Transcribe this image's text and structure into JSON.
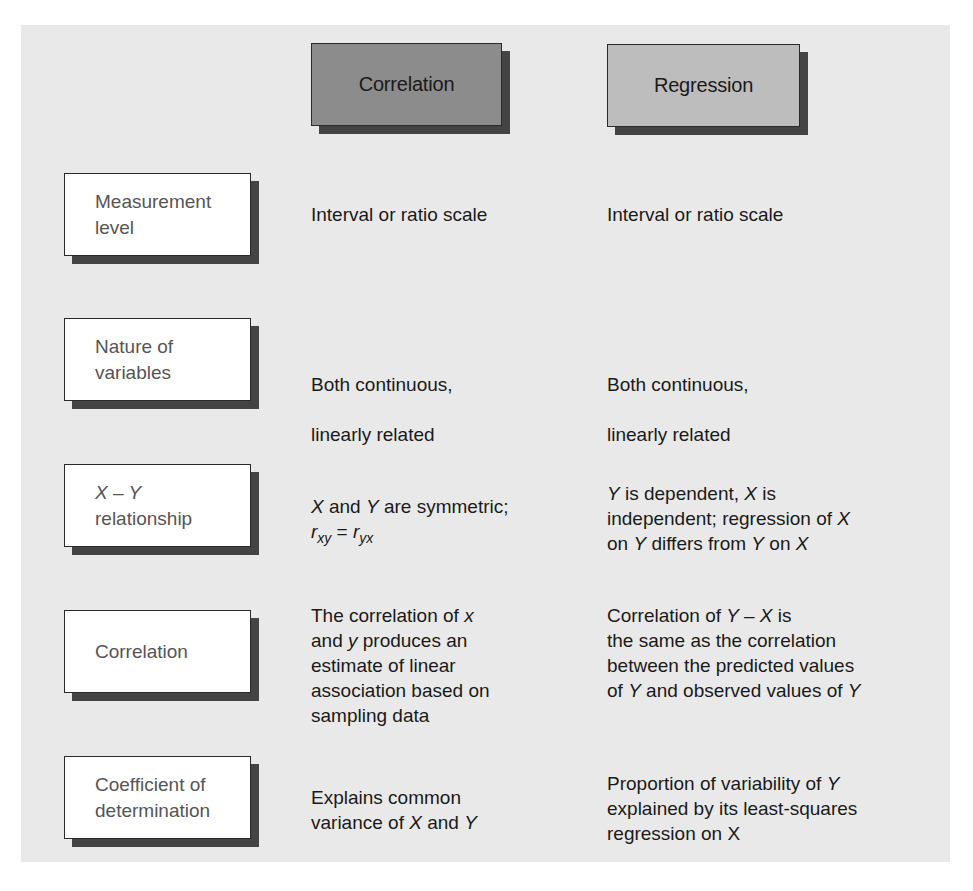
{
  "headers": {
    "correlation": {
      "label": "Correlation",
      "fill": "#8c8c8c"
    },
    "regression": {
      "label": "Regression",
      "fill": "#bdbdbd"
    }
  },
  "rows": [
    {
      "label": "Measurement level",
      "label_lines": [
        "Measurement",
        "level"
      ],
      "correlation": "Interval or ratio scale",
      "regression": "Interval or ratio scale"
    },
    {
      "label": "Nature of variables",
      "label_lines": [
        "Nature of",
        "variables"
      ],
      "correlation": "Both continuous, linearly related",
      "correlation_lines": [
        "Both continuous,",
        "linearly related"
      ],
      "regression": "Both continuous, linearly related",
      "regression_lines": [
        "Both continuous,",
        "linearly related"
      ]
    },
    {
      "label": "X – Y relationship",
      "label_lines": [
        "X – Y",
        "relationship"
      ],
      "correlation": "X and Y are symmetric; r_xy = r_yx",
      "correlation_parts": {
        "line1_a": "X",
        "line1_b": " and ",
        "line1_c": "Y",
        "line1_d": " are symmetric;",
        "r1": "r",
        "sub1": "xy",
        "eq": " = ",
        "r2": "r",
        "sub2": "yx"
      },
      "regression": "Y is dependent, X is independent; regression of X on Y differs from Y on X",
      "regression_parts": {
        "l1_a": "Y",
        "l1_b": " is dependent, ",
        "l1_c": "X",
        "l1_d": " is",
        "l2_a": "independent; regression of ",
        "l2_b": "X",
        "l3_a": "on ",
        "l3_b": "Y",
        "l3_c": " differs from ",
        "l3_d": "Y",
        "l3_e": " on ",
        "l3_f": "X"
      }
    },
    {
      "label": "Correlation",
      "label_lines": [
        "Correlation"
      ],
      "correlation": "The correlation of x and y produces an estimate of linear association based on sampling data",
      "correlation_parts": {
        "l1_a": "The correlation of ",
        "l1_b": "x",
        "l2_a": "and ",
        "l2_b": "y",
        "l2_c": " produces an",
        "l3": "estimate of linear",
        "l4": "association based on",
        "l5": "sampling data"
      },
      "regression": "Correlation of Y – X is the same as the correlation between the predicted values of Y and observed values of Y",
      "regression_parts": {
        "l1_a": "Correlation of ",
        "l1_b": "Y – X",
        "l1_c": " is",
        "l2": "the same as the correlation",
        "l3": "between the predicted values",
        "l4_a": "of ",
        "l4_b": "Y",
        "l4_c": " and observed values of ",
        "l4_d": "Y"
      }
    },
    {
      "label": "Coefficient of determination",
      "label_lines": [
        "Coefficient of",
        "determination"
      ],
      "correlation": "Explains common variance of X and Y",
      "correlation_parts": {
        "l1": "Explains common",
        "l2_a": "variance of ",
        "l2_b": "X",
        "l2_c": " and ",
        "l2_d": "Y"
      },
      "regression": "Proportion of variability of Y explained by its least-squares regression on X",
      "regression_parts": {
        "l1_a": "Proportion of variability of ",
        "l1_b": "Y",
        "l2": "explained by its least-squares",
        "l3": "regression on X"
      }
    }
  ],
  "colors": {
    "panel_background": "#e9e9e9",
    "page_background": "#ffffff",
    "box_shadow": "#444444",
    "label_text": "#555555",
    "body_text": "#1a1a1a"
  }
}
